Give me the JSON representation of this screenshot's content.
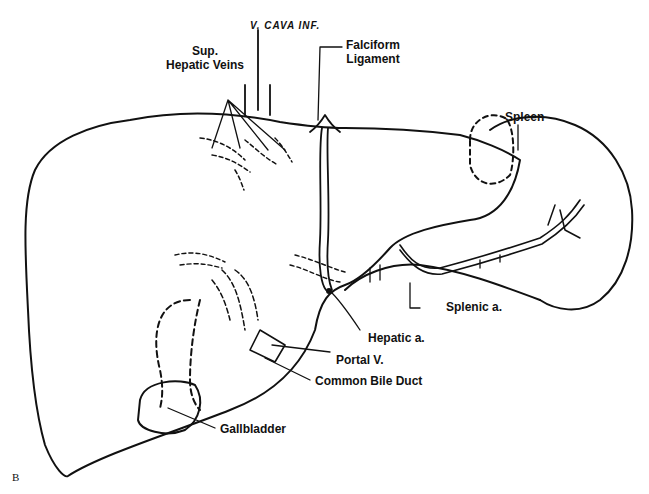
{
  "figure": {
    "panel_letter": "B",
    "labels": {
      "vena_cava": "V. CAVA  INF.",
      "sup_hepatic_veins": [
        "Sup.",
        "Hepatic Veins"
      ],
      "falciform": [
        "Falciform",
        "Ligament"
      ],
      "spleen": "Spleen",
      "splenic_a": "Splenic a.",
      "hepatic_a": "Hepatic a.",
      "portal_v": "Portal V.",
      "common_bile_duct": "Common Bile Duct",
      "gallbladder": "Gallbladder"
    },
    "colors": {
      "line": "#111111",
      "background": "#ffffff"
    }
  }
}
